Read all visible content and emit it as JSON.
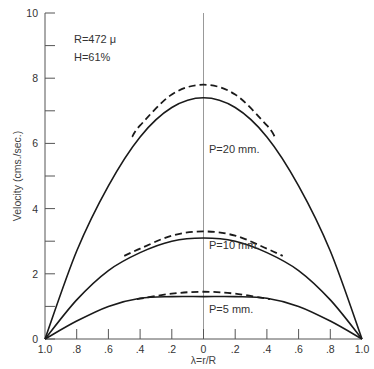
{
  "chart_data": {
    "type": "line",
    "title": "",
    "xlabel": "λ=r/R",
    "ylabel": "Velocity (cms./sec.)",
    "ylim": [
      0,
      10
    ],
    "xlim": [
      -1.0,
      1.0
    ],
    "grid": false,
    "x_tick_labels": [
      "1.0",
      ".8",
      ".6",
      ".4",
      ".2",
      "0",
      ".2",
      ".4",
      ".6",
      ".8",
      "1.0"
    ],
    "x_tick_values": [
      -1.0,
      -0.8,
      -0.6,
      -0.4,
      -0.2,
      0,
      0.2,
      0.4,
      0.6,
      0.8,
      1.0
    ],
    "y_tick_labels": [
      "0",
      "2",
      "4",
      "6",
      "8",
      "10"
    ],
    "y_tick_values": [
      0,
      2,
      4,
      6,
      8,
      10
    ],
    "y_minor_ticks": [
      1,
      3,
      5,
      7,
      9
    ],
    "annotations": {
      "radius": "R=472 μ",
      "humidity": "H=61%"
    },
    "x": [
      -1.0,
      -0.8,
      -0.6,
      -0.4,
      -0.2,
      0,
      0.2,
      0.4,
      0.6,
      0.8,
      1.0
    ],
    "series": [
      {
        "name": "P=20 mm. (observed)",
        "style": "solid",
        "values": [
          0,
          2.7,
          4.7,
          6.2,
          7.1,
          7.4,
          7.1,
          6.2,
          4.7,
          2.7,
          0
        ]
      },
      {
        "name": "P=20 mm. (theoretical)",
        "style": "dashed",
        "x": [
          -0.45,
          -0.4,
          -0.2,
          0,
          0.2,
          0.4,
          0.45
        ],
        "values": [
          6.2,
          6.55,
          7.5,
          7.8,
          7.5,
          6.55,
          6.2
        ]
      },
      {
        "name": "P=10 mm. (observed)",
        "style": "solid",
        "values": [
          0,
          1.2,
          2.1,
          2.65,
          3.0,
          3.1,
          3.0,
          2.65,
          2.1,
          1.2,
          0
        ]
      },
      {
        "name": "P=10 mm. (theoretical)",
        "style": "dashed",
        "x": [
          -0.5,
          -0.4,
          -0.2,
          0,
          0.2,
          0.4,
          0.5
        ],
        "values": [
          2.55,
          2.77,
          3.17,
          3.3,
          3.17,
          2.77,
          2.55
        ]
      },
      {
        "name": "P=5 mm. (observed)",
        "style": "solid",
        "values": [
          0,
          0.55,
          1.0,
          1.25,
          1.3,
          1.3,
          1.3,
          1.25,
          1.0,
          0.55,
          0
        ]
      },
      {
        "name": "P=5 mm. (theoretical)",
        "style": "dashed",
        "x": [
          -0.42,
          -0.2,
          0,
          0.2,
          0.42
        ],
        "values": [
          1.22,
          1.39,
          1.45,
          1.39,
          1.22
        ]
      }
    ],
    "curve_labels": [
      "P=20 mm.",
      "P=10 mm.",
      "P=5 mm."
    ]
  }
}
